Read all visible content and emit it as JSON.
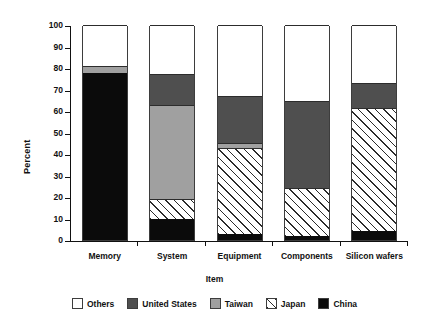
{
  "chart_data": {
    "type": "bar",
    "stacked": true,
    "title": "",
    "xlabel": "Item",
    "ylabel": "Percent",
    "ylim": [
      0,
      100
    ],
    "yticks": [
      0,
      10,
      20,
      30,
      40,
      50,
      60,
      70,
      80,
      90,
      100
    ],
    "grid": false,
    "legend_position": "bottom",
    "categories": [
      "Memory",
      "System",
      "Equipment",
      "Components",
      "Silicon wafers"
    ],
    "series": [
      {
        "name": "China",
        "color": "#0b0b0b",
        "values": [
          77.5,
          10.0,
          3.0,
          2.0,
          4.0
        ]
      },
      {
        "name": "Japan",
        "color": "#ffffff",
        "values": [
          0.0,
          9.0,
          40.0,
          22.0,
          57.5
        ]
      },
      {
        "name": "Taiwan",
        "color": "#a0a0a0",
        "values": [
          3.5,
          44.0,
          2.0,
          0.0,
          0.0
        ]
      },
      {
        "name": "United States",
        "color": "#4f4f4f",
        "values": [
          0.0,
          14.0,
          22.0,
          40.5,
          11.5
        ]
      },
      {
        "name": "Others",
        "color": "#ffffff",
        "values": [
          19.0,
          23.0,
          33.0,
          35.5,
          27.0
        ]
      }
    ],
    "legend": [
      {
        "label": "Others",
        "swatch": "others"
      },
      {
        "label": "United States",
        "swatch": "us"
      },
      {
        "label": "Taiwan",
        "swatch": "taiwan"
      },
      {
        "label": "Japan",
        "swatch": "japan"
      },
      {
        "label": "China",
        "swatch": "china"
      }
    ]
  }
}
